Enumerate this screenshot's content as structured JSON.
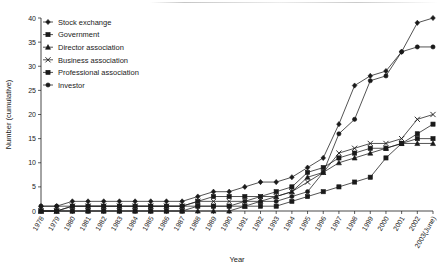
{
  "chart_data": {
    "type": "line",
    "title": "",
    "xlabel": "Year",
    "ylabel": "Number (cumulative)",
    "ylim": [
      0,
      40
    ],
    "yticks": [
      0,
      5,
      10,
      15,
      20,
      25,
      30,
      35,
      40
    ],
    "grid": false,
    "legend_position": "top-left",
    "categories": [
      "1978",
      "1979",
      "1980",
      "1981",
      "1982",
      "1983",
      "1984",
      "1985",
      "1986",
      "1987",
      "1988",
      "1989",
      "1990",
      "1991",
      "1992",
      "1993",
      "1994",
      "1995",
      "1996",
      "1997",
      "1998",
      "1999",
      "2000",
      "2001",
      "2002",
      "2003(June)"
    ],
    "series": [
      {
        "name": "Stock exchange",
        "marker": "diamond",
        "values": [
          1,
          1,
          2,
          2,
          2,
          2,
          2,
          2,
          2,
          2,
          3,
          4,
          4,
          5,
          6,
          6,
          7,
          9,
          11,
          18,
          26,
          28,
          29,
          33,
          39,
          40
        ]
      },
      {
        "name": "Government",
        "marker": "square",
        "values": [
          0,
          0,
          0,
          0,
          0,
          0,
          0,
          0,
          0,
          0,
          1,
          1,
          1,
          1,
          1,
          1,
          2,
          3,
          4,
          5,
          6,
          7,
          11,
          14,
          16,
          18
        ]
      },
      {
        "name": "Director association",
        "marker": "triangle",
        "values": [
          0,
          0,
          0,
          0,
          0,
          0,
          0,
          0,
          0,
          0,
          0,
          0,
          0,
          1,
          2,
          3,
          4,
          7,
          8,
          10,
          11,
          12,
          13,
          14,
          14,
          14
        ]
      },
      {
        "name": "Business association",
        "marker": "cross",
        "values": [
          0,
          0,
          1,
          1,
          1,
          1,
          1,
          1,
          1,
          1,
          2,
          2,
          2,
          2,
          3,
          3,
          4,
          6,
          8,
          12,
          13,
          14,
          14,
          15,
          19,
          20
        ]
      },
      {
        "name": "Professional association",
        "marker": "dash-square",
        "values": [
          0,
          0,
          1,
          1,
          1,
          1,
          1,
          1,
          1,
          1,
          2,
          3,
          3,
          3,
          3,
          4,
          5,
          8,
          9,
          11,
          12,
          13,
          13,
          14,
          15,
          15
        ]
      },
      {
        "name": "Investor",
        "marker": "circle",
        "values": [
          1,
          1,
          1,
          1,
          1,
          1,
          1,
          1,
          1,
          1,
          1,
          1,
          1,
          2,
          2,
          2,
          3,
          4,
          8,
          16,
          19,
          27,
          28,
          33,
          34,
          34
        ]
      }
    ]
  }
}
